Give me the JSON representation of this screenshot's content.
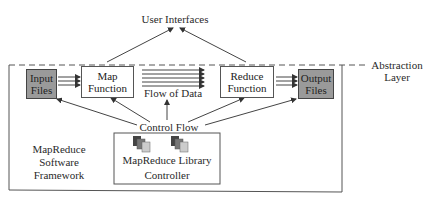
{
  "diagram": {
    "title_top": "User Interfaces",
    "abstraction_layer": {
      "line1": "Abstraction",
      "line2": "Layer"
    },
    "nodes": {
      "input_files": {
        "line1": "Input",
        "line2": "Files"
      },
      "map_function": {
        "line1": "Map",
        "line2": "Function"
      },
      "flow_of_data": "Flow of Data",
      "reduce_function": {
        "line1": "Reduce",
        "line2": "Function"
      },
      "output_files": {
        "line1": "Output",
        "line2": "Files"
      }
    },
    "control_flow": "Control Flow",
    "controller": {
      "library": "MapReduce Library",
      "label": "Controller"
    },
    "framework": {
      "line1": "MapReduce",
      "line2": "Software",
      "line3": "Framework"
    },
    "colors": {
      "file_fill": "#9a9a9a",
      "line": "#555555",
      "text": "#2a2a2a"
    }
  }
}
